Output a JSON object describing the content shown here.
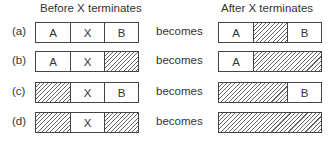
{
  "headers": {
    "before": "Before X terminates",
    "after": "After X terminates"
  },
  "connector": "becomes",
  "legend": {
    "hatched": "free (hole)"
  },
  "rows": [
    {
      "label": "(a)",
      "before": [
        {
          "text": "A",
          "free": false,
          "w": 1
        },
        {
          "text": "X",
          "free": false,
          "w": 1
        },
        {
          "text": "B",
          "free": false,
          "w": 1
        }
      ],
      "after": [
        {
          "text": "A",
          "free": false,
          "w": 1
        },
        {
          "text": "",
          "free": true,
          "w": 1
        },
        {
          "text": "B",
          "free": false,
          "w": 1
        }
      ]
    },
    {
      "label": "(b)",
      "before": [
        {
          "text": "A",
          "free": false,
          "w": 1
        },
        {
          "text": "X",
          "free": false,
          "w": 1
        },
        {
          "text": "",
          "free": true,
          "w": 1
        }
      ],
      "after": [
        {
          "text": "A",
          "free": false,
          "w": 1
        },
        {
          "text": "",
          "free": true,
          "w": 2
        }
      ]
    },
    {
      "label": "(c)",
      "before": [
        {
          "text": "",
          "free": true,
          "w": 1
        },
        {
          "text": "X",
          "free": false,
          "w": 1
        },
        {
          "text": "B",
          "free": false,
          "w": 1
        }
      ],
      "after": [
        {
          "text": "",
          "free": true,
          "w": 2
        },
        {
          "text": "B",
          "free": false,
          "w": 1
        }
      ]
    },
    {
      "label": "(d)",
      "before": [
        {
          "text": "",
          "free": true,
          "w": 1
        },
        {
          "text": "X",
          "free": false,
          "w": 1
        },
        {
          "text": "",
          "free": true,
          "w": 1
        }
      ],
      "after": [
        {
          "text": "",
          "free": true,
          "w": 3
        }
      ]
    }
  ]
}
